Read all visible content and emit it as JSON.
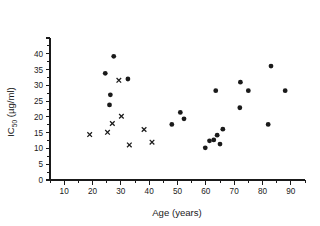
{
  "chart_data": {
    "type": "scatter",
    "title": "",
    "xlabel": "Age (years)",
    "ylabel": "IC50 (µg/ml)",
    "ylabel_base": "IC",
    "ylabel_sub": "50",
    "ylabel_unit": " (µg/ml)",
    "xlim": [
      5,
      95
    ],
    "ylim": [
      0,
      45
    ],
    "grid": false,
    "legend": "none",
    "xticks": [
      10,
      20,
      30,
      40,
      50,
      60,
      70,
      80,
      90
    ],
    "xtick_labels": [
      "10",
      "20",
      "30",
      "40",
      "50",
      "60",
      "70",
      "80",
      "90"
    ],
    "xminor_ticks": [
      5,
      15,
      25,
      35,
      45,
      55,
      65,
      75,
      85,
      95
    ],
    "yticks": [
      0,
      5,
      10,
      15,
      20,
      25,
      30,
      35,
      40
    ],
    "ytick_labels": [
      "0",
      "5",
      "10",
      "15",
      "20",
      "25",
      "30",
      "35",
      "40"
    ],
    "yminor_ticks": [
      45
    ],
    "series": [
      {
        "name": "filled-circle-series",
        "marker": "circle",
        "color": "#1a1a1a",
        "points": [
          {
            "x": 24.5,
            "y": 33.8
          },
          {
            "x": 26.0,
            "y": 23.8
          },
          {
            "x": 26.3,
            "y": 27.0
          },
          {
            "x": 27.5,
            "y": 39.2
          },
          {
            "x": 32.5,
            "y": 32.0
          },
          {
            "x": 48.0,
            "y": 17.6
          },
          {
            "x": 51.0,
            "y": 21.4
          },
          {
            "x": 52.3,
            "y": 19.4
          },
          {
            "x": 59.8,
            "y": 10.2
          },
          {
            "x": 61.3,
            "y": 12.4
          },
          {
            "x": 62.8,
            "y": 12.7
          },
          {
            "x": 63.5,
            "y": 28.3
          },
          {
            "x": 64.0,
            "y": 14.2
          },
          {
            "x": 65.0,
            "y": 11.4
          },
          {
            "x": 66.0,
            "y": 16.1
          },
          {
            "x": 72.0,
            "y": 22.9
          },
          {
            "x": 72.2,
            "y": 31.0
          },
          {
            "x": 75.0,
            "y": 28.3
          },
          {
            "x": 82.0,
            "y": 17.6
          },
          {
            "x": 83.0,
            "y": 36.1
          },
          {
            "x": 88.0,
            "y": 28.3
          }
        ]
      },
      {
        "name": "cross-series",
        "marker": "x",
        "color": "#1a1a1a",
        "points": [
          {
            "x": 19.0,
            "y": 14.4
          },
          {
            "x": 25.3,
            "y": 15.1
          },
          {
            "x": 27.0,
            "y": 17.9
          },
          {
            "x": 29.3,
            "y": 31.6
          },
          {
            "x": 30.2,
            "y": 20.2
          },
          {
            "x": 33.0,
            "y": 11.1
          },
          {
            "x": 38.2,
            "y": 16.0
          },
          {
            "x": 41.0,
            "y": 12.0
          }
        ]
      }
    ]
  },
  "axes": {
    "x_axis_name": "x-axis",
    "y_axis_name": "y-axis"
  }
}
